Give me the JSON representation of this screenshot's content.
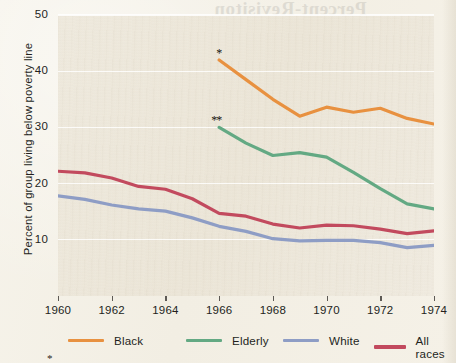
{
  "chart_data": {
    "type": "line",
    "title": "",
    "xlabel": "",
    "ylabel": "Percent of group living below poverty line",
    "xlim": [
      1960,
      1974
    ],
    "ylim": [
      0,
      50
    ],
    "xticks": [
      1960,
      1962,
      1964,
      1966,
      1968,
      1970,
      1972,
      1974
    ],
    "yticks": [
      10,
      20,
      30,
      40,
      50
    ],
    "grid": "horizontal",
    "legend_position": "bottom",
    "annotations": [
      {
        "text": "*",
        "series": "Black",
        "x": 1966,
        "y": 42.0
      },
      {
        "text": "**",
        "series": "Elderly",
        "x": 1966,
        "y": 30.0
      }
    ],
    "series": [
      {
        "name": "Black",
        "color": "#E89140",
        "x": [
          1966,
          1967,
          1968,
          1969,
          1970,
          1971,
          1972,
          1973,
          1974
        ],
        "values": [
          42.0,
          38.5,
          35.0,
          32.0,
          33.6,
          32.7,
          33.4,
          31.6,
          30.6
        ]
      },
      {
        "name": "Elderly",
        "color": "#63A983",
        "x": [
          1966,
          1967,
          1968,
          1969,
          1970,
          1971,
          1972,
          1973,
          1974
        ],
        "values": [
          30.0,
          27.2,
          25.0,
          25.5,
          24.7,
          22.0,
          19.1,
          16.4,
          15.5
        ]
      },
      {
        "name": "White",
        "color": "#8E9DC5",
        "x": [
          1960,
          1961,
          1962,
          1963,
          1964,
          1965,
          1966,
          1967,
          1968,
          1969,
          1970,
          1971,
          1972,
          1973,
          1974
        ],
        "values": [
          17.8,
          17.2,
          16.2,
          15.5,
          15.1,
          13.9,
          12.4,
          11.5,
          10.2,
          9.8,
          9.9,
          9.9,
          9.5,
          8.6,
          9.0
        ]
      },
      {
        "name": "All races",
        "color": "#C24A5E",
        "x": [
          1960,
          1961,
          1962,
          1963,
          1964,
          1965,
          1966,
          1967,
          1968,
          1969,
          1970,
          1971,
          1972,
          1973,
          1974
        ],
        "values": [
          22.2,
          21.9,
          21.0,
          19.5,
          19.0,
          17.3,
          14.7,
          14.2,
          12.8,
          12.1,
          12.6,
          12.5,
          11.9,
          11.1,
          11.6
        ]
      }
    ]
  },
  "legend": {
    "items": [
      {
        "label": "Black",
        "color": "#E89140"
      },
      {
        "label": "Elderly",
        "color": "#63A983"
      },
      {
        "label": "White",
        "color": "#8E9DC5"
      },
      {
        "label": "All races",
        "color": "#C24A5E"
      }
    ]
  },
  "footnote_marker": "*",
  "bleed_through": {
    "heading": "Percent-Revisiton",
    "lines": [
      "the national poverty rate fell",
      "among families with the head",
      "of household working full",
      "time and year round while",
      "the share of children living",
      "with a single parent rose in",
      "these years as measured by",
      "the census bureau surveys",
      "of income and program",
      "participation data series"
    ]
  }
}
